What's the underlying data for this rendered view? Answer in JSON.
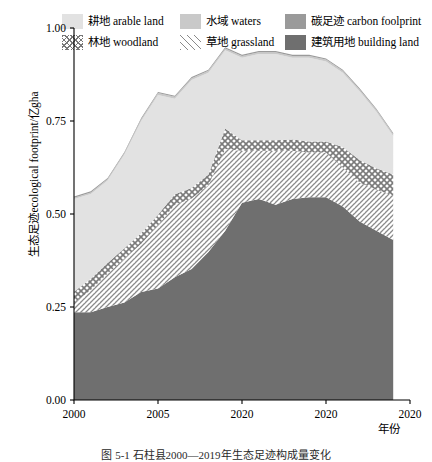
{
  "legend": {
    "rows": [
      [
        {
          "key": "arable",
          "pattern": "solid-light",
          "label": "耕地 arable land"
        },
        {
          "key": "waters",
          "pattern": "solid-medium",
          "label": "水域 waters"
        },
        {
          "key": "carbon",
          "pattern": "solid-dark",
          "label": "碳足迹 carbon foolprint"
        }
      ],
      [
        {
          "key": "woodland",
          "pattern": "crosshatch",
          "label": "林地 woodland"
        },
        {
          "key": "grassland",
          "pattern": "diagonal",
          "label": "草地 grassland"
        },
        {
          "key": "building",
          "pattern": "solid-darkest",
          "label": "建筑用地 building land"
        }
      ]
    ]
  },
  "axes": {
    "ylabel": "生态足迹ecological footprint/亿gha",
    "xlabel": "年份",
    "yticks": [
      "0.00",
      "0.25",
      "0.50",
      "0.75",
      "1.00"
    ],
    "ytick_values": [
      0.0,
      0.25,
      0.5,
      0.75,
      1.0
    ],
    "xticks": [
      "2000",
      "2005",
      "2020",
      "2020",
      "2020"
    ],
    "xtick_values": [
      2000,
      2005,
      2010,
      2015,
      2020
    ]
  },
  "caption": "图 5-1  石柱县2000—2019年生态足迹构成量变化",
  "colors": {
    "arable": "#e2e2e2",
    "waters": "#c9c9c9",
    "carbon": "#9a9a9a",
    "building": "#6f6f6f",
    "hatch": "#7a7a7a",
    "axis": "#000000"
  },
  "chart_data": {
    "type": "area",
    "title": "",
    "xlabel": "年份",
    "ylabel": "生态足迹ecological footprint/亿gha",
    "xlim": [
      2000,
      2020
    ],
    "ylim": [
      0.0,
      1.0
    ],
    "grid": false,
    "legend_position": "top",
    "stacked": true,
    "stack_order_bottom_to_top": [
      "building",
      "grassland",
      "woodland",
      "arable",
      "waters",
      "carbon"
    ],
    "x": [
      2000,
      2001,
      2002,
      2003,
      2004,
      2005,
      2006,
      2007,
      2008,
      2009,
      2010,
      2011,
      2012,
      2013,
      2014,
      2015,
      2016,
      2017,
      2018,
      2019
    ],
    "series": [
      {
        "name": "建筑用地 building land",
        "key": "building",
        "values": [
          0.236,
          0.236,
          0.25,
          0.262,
          0.29,
          0.3,
          0.33,
          0.352,
          0.398,
          0.455,
          0.53,
          0.54,
          0.525,
          0.54,
          0.545,
          0.545,
          0.52,
          0.48,
          0.455,
          0.43
        ]
      },
      {
        "name": "草地 grassland",
        "key": "grassland",
        "values": [
          0.025,
          0.06,
          0.09,
          0.118,
          0.13,
          0.17,
          0.195,
          0.19,
          0.18,
          0.22,
          0.14,
          0.13,
          0.145,
          0.13,
          0.12,
          0.12,
          0.105,
          0.105,
          0.11,
          0.12
        ]
      },
      {
        "name": "林地 woodland",
        "key": "woodland",
        "values": [
          0.03,
          0.03,
          0.028,
          0.028,
          0.028,
          0.028,
          0.028,
          0.028,
          0.028,
          0.055,
          0.028,
          0.028,
          0.028,
          0.03,
          0.03,
          0.03,
          0.055,
          0.06,
          0.058,
          0.056
        ]
      },
      {
        "name": "耕地 arable land",
        "key": "arable",
        "values": [
          0.249,
          0.228,
          0.222,
          0.252,
          0.302,
          0.322,
          0.257,
          0.29,
          0.274,
          0.21,
          0.222,
          0.232,
          0.232,
          0.22,
          0.225,
          0.215,
          0.2,
          0.185,
          0.152,
          0.104
        ]
      },
      {
        "name": "水域 waters",
        "key": "waters",
        "values": [
          0.004,
          0.004,
          0.004,
          0.004,
          0.005,
          0.005,
          0.005,
          0.005,
          0.005,
          0.005,
          0.005,
          0.005,
          0.005,
          0.005,
          0.005,
          0.005,
          0.005,
          0.005,
          0.005,
          0.005
        ]
      },
      {
        "name": "碳足迹 carbon foolprint",
        "key": "carbon",
        "values": [
          0.003,
          0.003,
          0.003,
          0.003,
          0.003,
          0.003,
          0.003,
          0.003,
          0.003,
          0.003,
          0.003,
          0.003,
          0.003,
          0.003,
          0.003,
          0.003,
          0.003,
          0.003,
          0.003,
          0.003
        ]
      }
    ]
  }
}
